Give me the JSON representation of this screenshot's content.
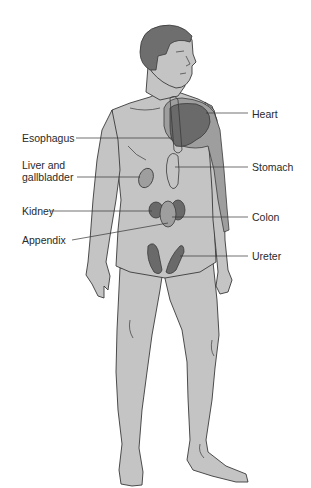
{
  "figure": {
    "colors": {
      "skin": "#c4c4c4",
      "outline": "#3a3a3a",
      "hair": "#6e6e6e",
      "organ_light": "#9e9e9e",
      "organ_dark": "#6a6a6a",
      "leader_line": "#333333",
      "label_text": "#2a2a2a"
    },
    "labels": {
      "heart": "Heart",
      "esophagus": "Esophagus",
      "stomach": "Stomach",
      "liver_line1": "Liver and",
      "liver_line2": "gallbladder",
      "kidney": "Kidney",
      "colon": "Colon",
      "appendix": "Appendix",
      "ureter": "Ureter"
    }
  }
}
